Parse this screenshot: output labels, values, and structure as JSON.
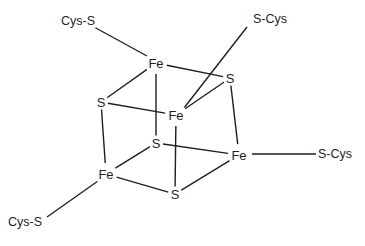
{
  "diagram": {
    "kind": "chemical-structure",
    "canvas": {
      "width": 365,
      "height": 246,
      "background": "#ffffff"
    },
    "stroke_color": "#1f1f1f",
    "text_color": "#1f1f1f",
    "atoms": [
      {
        "id": "fe-top",
        "label": "Fe",
        "x": 156,
        "y": 63
      },
      {
        "id": "fe-center",
        "label": "Fe",
        "x": 176,
        "y": 115
      },
      {
        "id": "fe-bottomleft",
        "label": "Fe",
        "x": 106,
        "y": 174
      },
      {
        "id": "fe-right",
        "label": "Fe",
        "x": 239,
        "y": 155
      },
      {
        "id": "s-left",
        "label": "S",
        "x": 101,
        "y": 102
      },
      {
        "id": "s-upperright",
        "label": "S",
        "x": 230,
        "y": 78
      },
      {
        "id": "s-inner",
        "label": "S",
        "x": 156,
        "y": 143
      },
      {
        "id": "s-bottom",
        "label": "S",
        "x": 175,
        "y": 194
      }
    ],
    "ligands": [
      {
        "id": "cys-top-left",
        "label": "Cys-S",
        "x": 78,
        "y": 21,
        "bonded_to": "fe-top"
      },
      {
        "id": "cys-top-right",
        "label": "S-Cys",
        "x": 270,
        "y": 19,
        "bonded_to": "fe-center"
      },
      {
        "id": "cys-right",
        "label": "S-Cys",
        "x": 335,
        "y": 154,
        "bonded_to": "fe-right"
      },
      {
        "id": "cys-bottom-left",
        "label": "Cys-S",
        "x": 25,
        "y": 222,
        "bonded_to": "fe-bottomleft"
      }
    ],
    "bonds": [
      {
        "id": "bond-fetop-sleft",
        "from": "fe-top",
        "to": "s-left"
      },
      {
        "id": "bond-fetop-supperright",
        "from": "fe-top",
        "to": "s-upperright"
      },
      {
        "id": "bond-fetop-sinner",
        "from": "fe-top",
        "to": "s-inner"
      },
      {
        "id": "bond-fecenter-sleft",
        "from": "fe-center",
        "to": "s-left"
      },
      {
        "id": "bond-fecenter-supperright",
        "from": "fe-center",
        "to": "s-upperright"
      },
      {
        "id": "bond-fecenter-sbottom",
        "from": "fe-center",
        "to": "s-bottom"
      },
      {
        "id": "bond-febl-sleft",
        "from": "fe-bottomleft",
        "to": "s-left"
      },
      {
        "id": "bond-febl-sinner",
        "from": "fe-bottomleft",
        "to": "s-inner"
      },
      {
        "id": "bond-febl-sbottom",
        "from": "fe-bottomleft",
        "to": "s-bottom"
      },
      {
        "id": "bond-feright-supperright",
        "from": "fe-right",
        "to": "s-upperright"
      },
      {
        "id": "bond-feright-sinner",
        "from": "fe-right",
        "to": "s-inner"
      },
      {
        "id": "bond-feright-sbottom",
        "from": "fe-right",
        "to": "s-bottom"
      }
    ],
    "ligand_bonds": [
      {
        "id": "ligbond-top-left",
        "x1": 94,
        "y1": 27,
        "x2": 147,
        "y2": 56
      },
      {
        "id": "ligbond-top-right",
        "x1": 247,
        "y1": 27,
        "x2": 184,
        "y2": 108
      },
      {
        "id": "ligbond-right",
        "x1": 252,
        "y1": 154,
        "x2": 316,
        "y2": 154
      },
      {
        "id": "ligbond-bottom-left",
        "x1": 47,
        "y1": 217,
        "x2": 98,
        "y2": 181
      }
    ]
  }
}
